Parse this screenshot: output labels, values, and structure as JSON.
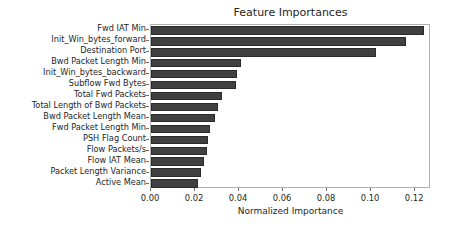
{
  "chart_data": {
    "type": "bar",
    "orientation": "horizontal",
    "title": "Feature Importances",
    "xlabel": "Normalized Importance",
    "ylabel": "",
    "xlim": [
      0.0,
      0.1272
    ],
    "grid": false,
    "legend": null,
    "bar_color": "#404040",
    "xticks": [
      0.0,
      0.02,
      0.04,
      0.06,
      0.08,
      0.1,
      0.12
    ],
    "xtick_labels": [
      "0.00",
      "0.02",
      "0.04",
      "0.06",
      "0.08",
      "0.10",
      "0.12"
    ],
    "categories": [
      "Fwd IAT Min",
      "Init_Win_bytes_forward",
      "Destination Port",
      "Bwd Packet Length Min",
      "Init_Win_bytes_backward",
      "Subflow Fwd Bytes",
      "Total Fwd Packets",
      "Total Length of Bwd Packets",
      "Bwd Packet Length Mean",
      "Fwd Packet Length Min",
      "PSH Flag Count",
      "Flow Packets/s",
      "Flow IAT Mean",
      "Packet Length Variance",
      "Active Mean"
    ],
    "values": [
      0.124,
      0.1158,
      0.1023,
      0.041,
      0.0389,
      0.0385,
      0.0322,
      0.0303,
      0.0289,
      0.0267,
      0.0261,
      0.0253,
      0.024,
      0.0227,
      0.0213
    ]
  }
}
